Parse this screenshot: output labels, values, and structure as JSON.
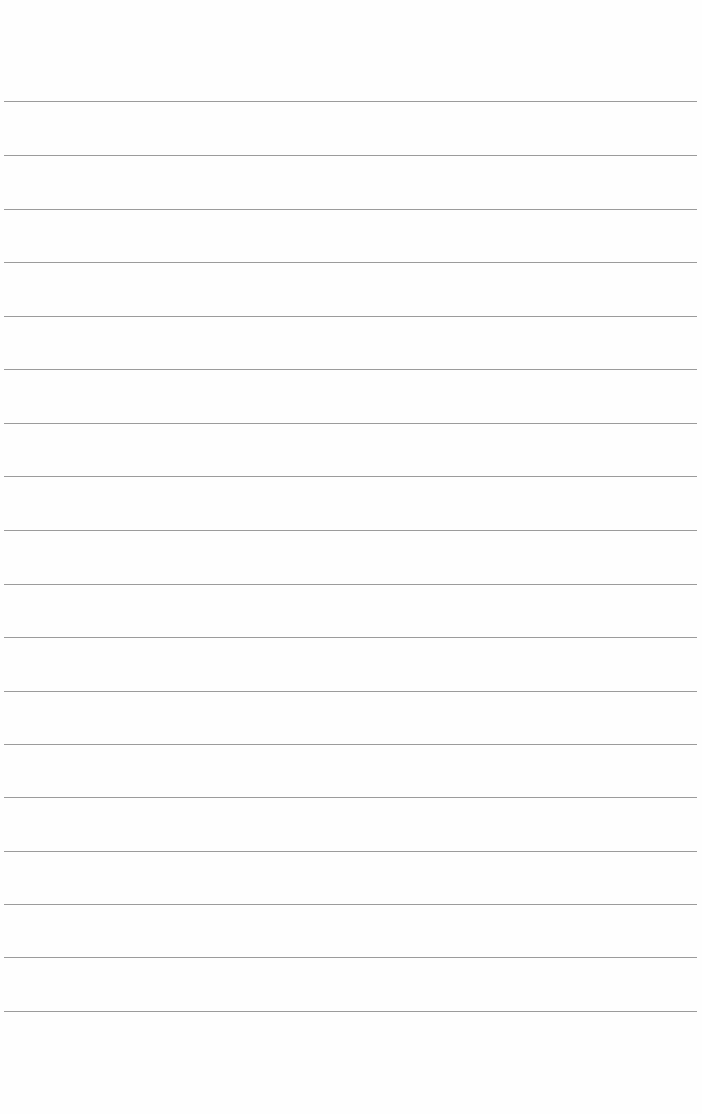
{
  "page": {
    "type": "ruled-paper",
    "background_color": "#fefefe",
    "line_color": "#8a8a8a",
    "line_count": 18,
    "line_positions_y": [
      101,
      155,
      209,
      262,
      316,
      369,
      423,
      476,
      530,
      584,
      637,
      691,
      744,
      797,
      851,
      904,
      957,
      1011
    ]
  }
}
